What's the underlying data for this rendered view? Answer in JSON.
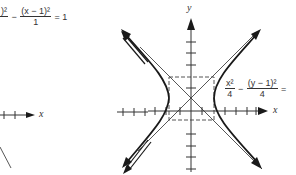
{
  "figure": {
    "left_panel": {
      "equation": {
        "term1_numerator": ")²",
        "minus": "−",
        "term2_numerator": "(x − 1)²",
        "term2_denominator": "1",
        "equals": "= 1"
      },
      "x_axis_label": "x"
    },
    "right_panel": {
      "equation": {
        "term1_numerator": "x²",
        "term1_denominator": "4",
        "minus": "−",
        "term2_numerator": "(y − 1)²",
        "term2_denominator": "4",
        "equals": "="
      },
      "x_axis_label": "x",
      "y_axis_label": "y"
    },
    "colors": {
      "curve": "#1a1a1a",
      "axis": "#333333",
      "asymptote": "#444444",
      "dashed_box": "#555555"
    }
  }
}
